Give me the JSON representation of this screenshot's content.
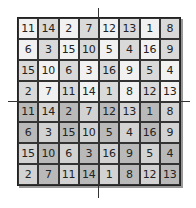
{
  "grid": {
    "rows": [
      [
        11,
        14,
        2,
        7,
        12,
        13,
        1,
        8
      ],
      [
        6,
        3,
        15,
        10,
        5,
        4,
        16,
        9
      ],
      [
        15,
        10,
        6,
        3,
        16,
        9,
        5,
        4
      ],
      [
        2,
        7,
        11,
        14,
        1,
        8,
        12,
        13
      ],
      [
        11,
        14,
        2,
        7,
        12,
        13,
        1,
        8
      ],
      [
        6,
        3,
        15,
        10,
        5,
        4,
        16,
        9
      ],
      [
        15,
        10,
        6,
        3,
        16,
        9,
        5,
        4
      ],
      [
        2,
        7,
        11,
        14,
        1,
        8,
        12,
        13
      ]
    ],
    "shading": [
      [
        0,
        1,
        0,
        1,
        0,
        1,
        0,
        1
      ],
      [
        0,
        1,
        0,
        1,
        0,
        1,
        0,
        1
      ],
      [
        1,
        0,
        1,
        0,
        1,
        0,
        1,
        0
      ],
      [
        1,
        0,
        1,
        0,
        1,
        0,
        1,
        0
      ],
      [
        3,
        2,
        3,
        2,
        3,
        2,
        3,
        2
      ],
      [
        3,
        2,
        3,
        2,
        3,
        2,
        3,
        2
      ],
      [
        2,
        3,
        2,
        3,
        2,
        3,
        2,
        3
      ],
      [
        2,
        3,
        2,
        3,
        2,
        3,
        2,
        3
      ]
    ],
    "colors": {
      "light": "#f1f1f1",
      "mid": "#d9d9d9",
      "light2": "#d2d2d2",
      "dark": "#b9b9b9"
    }
  }
}
